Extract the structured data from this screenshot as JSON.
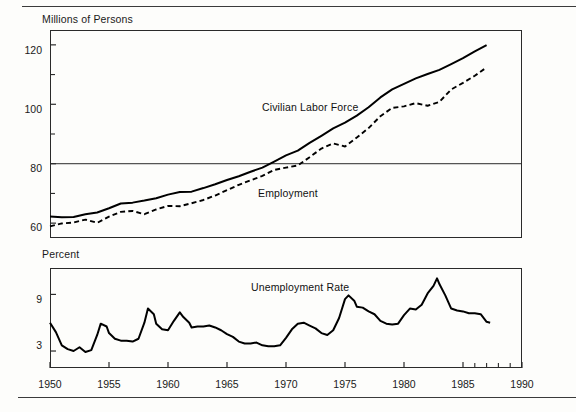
{
  "page": {
    "background_color": "#fdfdfb",
    "rule_color": "#3b3b3b",
    "line_color": "#000000"
  },
  "chart_data": [
    {
      "type": "line",
      "id": "labor-force-employment",
      "title": "",
      "ylabel": "Millions of Persons",
      "xlabel": "",
      "xlim": [
        1950,
        1990
      ],
      "ylim": [
        55,
        125
      ],
      "yticks": [
        60,
        80,
        100,
        120
      ],
      "yticks_minor": [
        70,
        90,
        110
      ],
      "ytick_labels": [
        "60",
        "80",
        "100",
        "120"
      ],
      "grid": true,
      "gridlines_y": [
        80
      ],
      "legend_position": "inline-annotation",
      "annotations": [
        {
          "text": "Civilian Labor Force",
          "x": 1967.5,
          "y": 98
        },
        {
          "text": "Employment",
          "x": 1966.5,
          "y": 69
        }
      ],
      "series": [
        {
          "name": "Civilian Labor Force",
          "style": "solid",
          "x": [
            1950,
            1951,
            1952,
            1953,
            1954,
            1955,
            1956,
            1957,
            1958,
            1959,
            1960,
            1961,
            1962,
            1963,
            1964,
            1965,
            1966,
            1967,
            1968,
            1969,
            1970,
            1971,
            1972,
            1973,
            1974,
            1975,
            1976,
            1977,
            1978,
            1979,
            1980,
            1981,
            1982,
            1983,
            1984,
            1985,
            1986,
            1987
          ],
          "values": [
            62.2,
            62.0,
            62.1,
            63.0,
            63.6,
            65.0,
            66.6,
            66.9,
            67.6,
            68.4,
            69.6,
            70.5,
            70.6,
            71.8,
            73.1,
            74.5,
            75.8,
            77.3,
            78.7,
            80.7,
            82.8,
            84.4,
            87.0,
            89.4,
            91.9,
            93.8,
            96.2,
            99.0,
            102.3,
            105.0,
            106.9,
            108.7,
            110.2,
            111.6,
            113.5,
            115.5,
            117.8,
            119.9
          ],
          "note": "Values in millions of persons, annual; ends 1987 near 122"
        },
        {
          "name": "Employment",
          "style": "dashed",
          "x": [
            1950,
            1951,
            1952,
            1953,
            1954,
            1955,
            1956,
            1957,
            1958,
            1959,
            1960,
            1961,
            1962,
            1963,
            1964,
            1965,
            1966,
            1967,
            1968,
            1969,
            1970,
            1971,
            1972,
            1973,
            1974,
            1975,
            1976,
            1977,
            1978,
            1979,
            1980,
            1981,
            1982,
            1983,
            1984,
            1985,
            1986,
            1987
          ],
          "values": [
            58.9,
            59.9,
            60.2,
            61.2,
            60.1,
            62.2,
            63.8,
            64.1,
            63.0,
            64.6,
            65.8,
            65.7,
            66.7,
            67.8,
            69.3,
            71.1,
            72.9,
            74.4,
            75.9,
            77.9,
            78.7,
            79.4,
            82.2,
            85.1,
            86.8,
            85.8,
            88.8,
            92.0,
            96.0,
            98.8,
            99.3,
            100.4,
            99.5,
            100.8,
            105.0,
            107.2,
            109.6,
            112.4
          ],
          "note": "Values in millions of persons, annual; ends 1987 near 115"
        }
      ]
    },
    {
      "type": "line",
      "id": "unemployment-rate",
      "title": "",
      "ylabel": "Percent",
      "xlabel": "",
      "xlim": [
        1950,
        1990
      ],
      "ylim": [
        1.2,
        11.8
      ],
      "yticks": [
        3,
        9
      ],
      "ytick_labels": [
        "3",
        "9"
      ],
      "grid": false,
      "legend_position": "inline-annotation",
      "annotations": [
        {
          "text": "Unemployment Rate",
          "x": 1966.5,
          "y": 8.6
        }
      ],
      "series": [
        {
          "name": "Unemployment Rate",
          "style": "solid",
          "x": [
            1950,
            1950.5,
            1951,
            1951.5,
            1952,
            1952.5,
            1953,
            1953.5,
            1954,
            1954.3,
            1954.8,
            1955,
            1955.5,
            1956,
            1956.5,
            1957,
            1957.5,
            1958,
            1958.3,
            1958.8,
            1959,
            1959.5,
            1960,
            1960.5,
            1961,
            1961.3,
            1961.8,
            1962,
            1962.5,
            1963,
            1963.5,
            1964,
            1964.5,
            1965,
            1965.5,
            1966,
            1966.5,
            1967,
            1967.5,
            1968,
            1968.5,
            1969,
            1969.5,
            1970,
            1970.5,
            1971,
            1971.5,
            1972,
            1972.5,
            1973,
            1973.5,
            1974,
            1974.5,
            1975,
            1975.3,
            1975.8,
            1976,
            1976.5,
            1977,
            1977.5,
            1978,
            1978.5,
            1979,
            1979.5,
            1980,
            1980.5,
            1981,
            1981.5,
            1982,
            1982.5,
            1982.8,
            1983,
            1983.5,
            1984,
            1984.5,
            1985,
            1985.5,
            1986,
            1986.5,
            1987,
            1987.3
          ],
          "values": [
            6.0,
            5.0,
            3.6,
            3.2,
            3.0,
            3.4,
            2.9,
            3.1,
            4.7,
            5.9,
            5.6,
            4.9,
            4.3,
            4.1,
            4.1,
            4.0,
            4.3,
            6.0,
            7.5,
            6.9,
            5.9,
            5.3,
            5.2,
            6.2,
            7.1,
            6.6,
            6.0,
            5.5,
            5.6,
            5.6,
            5.7,
            5.5,
            5.2,
            4.8,
            4.5,
            4.0,
            3.8,
            3.8,
            3.9,
            3.6,
            3.5,
            3.5,
            3.6,
            4.4,
            5.3,
            5.9,
            6.0,
            5.7,
            5.4,
            4.9,
            4.7,
            5.2,
            6.5,
            8.5,
            8.9,
            8.3,
            7.7,
            7.6,
            7.2,
            6.9,
            6.2,
            5.9,
            5.8,
            5.9,
            6.8,
            7.5,
            7.4,
            7.9,
            9.1,
            9.9,
            10.7,
            10.1,
            8.9,
            7.5,
            7.3,
            7.2,
            7.0,
            7.0,
            6.9,
            6.1,
            6.0
          ],
          "note": "Percent; peak about 10.7 in late 1982, trough about 2.9 in 1953"
        }
      ]
    }
  ],
  "axes": {
    "top_panel": {
      "ylabel": "Millions of Persons",
      "ytick_labels": [
        "120",
        "100",
        "80",
        "60"
      ]
    },
    "bottom_panel": {
      "ylabel": "Percent",
      "ytick_labels": [
        "9",
        "3"
      ]
    },
    "xtick_labels": [
      "1950",
      "1955",
      "1960",
      "1965",
      "1970",
      "1975",
      "1980",
      "1985",
      "1990"
    ]
  },
  "labels": {
    "civilian_labor_force": "Civilian Labor Force",
    "employment": "Employment",
    "unemployment_rate": "Unemployment Rate"
  }
}
